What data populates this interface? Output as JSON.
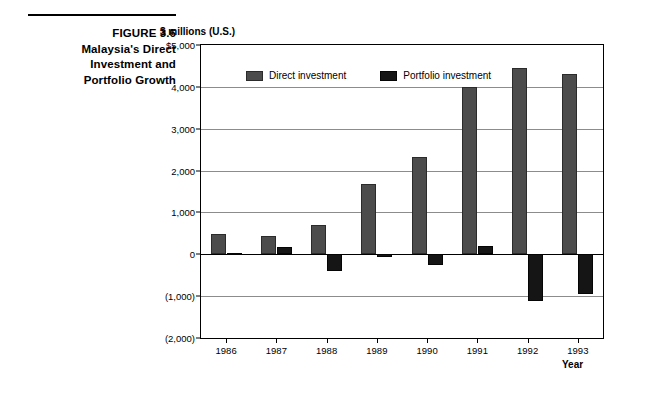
{
  "caption": {
    "lines": [
      "FIGURE 3.6",
      "Malaysia's Direct",
      "Investment and",
      "Portfolio Growth"
    ]
  },
  "chart_data": {
    "type": "bar",
    "title": "Malaysia's Direct Investment and Portfolio Growth",
    "figure_number": "FIGURE 3.6",
    "xlabel": "Year",
    "ylabel": "$ millions (U.S.)",
    "categories": [
      "1986",
      "1987",
      "1988",
      "1989",
      "1990",
      "1991",
      "1992",
      "1993"
    ],
    "series": [
      {
        "name": "Direct investment",
        "color": "#4c4c4c",
        "values": [
          480,
          440,
          700,
          1670,
          2330,
          3990,
          4450,
          4300
        ]
      },
      {
        "name": "Portfolio investment",
        "color": "#151515",
        "values": [
          40,
          180,
          -400,
          -70,
          -260,
          200,
          -1110,
          -950
        ]
      }
    ],
    "ylim": [
      -2000,
      5000
    ],
    "ytick_values": [
      5000,
      4000,
      3000,
      2000,
      1000,
      0,
      -1000,
      -2000
    ],
    "ytick_labels": [
      "$5,000",
      "4,000",
      "3,000",
      "2,000",
      "1,000",
      "0",
      "(1,000)",
      "(2,000)"
    ],
    "grid": true,
    "legend_position": "top-left-inside"
  }
}
